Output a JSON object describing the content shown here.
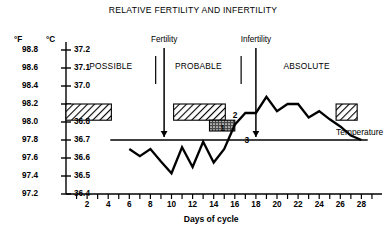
{
  "chart_data": {
    "type": "line",
    "title": "RELATIVE FERTILITY AND INFERTILITY",
    "xlabel": "Days of cycle",
    "ylabel_left": "°F",
    "ylabel_right": "°C",
    "xlim": [
      0,
      29
    ],
    "xticks": [
      1,
      2,
      3,
      4,
      5,
      6,
      7,
      8,
      9,
      10,
      11,
      12,
      13,
      14,
      15,
      16,
      17,
      18,
      19,
      20,
      21,
      22,
      23,
      24,
      25,
      26,
      27,
      28,
      29
    ],
    "xtick_labels": [
      2,
      4,
      6,
      8,
      10,
      12,
      14,
      16,
      18,
      20,
      22,
      24,
      26,
      28
    ],
    "ylim_f": [
      97.2,
      98.8
    ],
    "yticks_f": [
      "98.8",
      "98.6",
      "98.4",
      "98.2",
      "98.0",
      "97.8",
      "97.6",
      "97.4",
      "97.2"
    ],
    "yticks_c": [
      "37.2",
      "37.1",
      "37.0",
      "",
      "36.8",
      "36.7",
      "36.6",
      "36.5",
      "36.4"
    ],
    "grid": false,
    "legend_position": "right",
    "series": [
      {
        "name": "Temperature",
        "x": [
          6,
          7,
          8,
          9,
          10,
          11,
          12,
          13,
          14,
          15,
          16,
          17,
          18,
          19,
          20,
          21,
          22,
          23,
          24,
          25,
          26,
          27,
          28
        ],
        "values": [
          97.7,
          97.62,
          97.7,
          97.56,
          97.43,
          97.72,
          97.5,
          97.78,
          97.55,
          97.7,
          97.97,
          98.1,
          98.1,
          98.28,
          98.12,
          98.2,
          98.2,
          98.05,
          98.12,
          98.03,
          97.95,
          97.85,
          97.8
        ]
      }
    ],
    "coverline_f": 97.8,
    "coverline_x_start": 4.2,
    "coverline_x_end": 28.6,
    "annotations": [
      {
        "label": "Fertility",
        "type": "arrow-down",
        "x": 9.3
      },
      {
        "label": "Infertility",
        "type": "arrow-down",
        "x": 18.0
      },
      {
        "label": "1",
        "type": "marker",
        "x": 14.9,
        "y": 97.93
      },
      {
        "label": "2",
        "type": "marker",
        "x": 16.1,
        "y": 98.08
      },
      {
        "label": "3",
        "type": "marker",
        "x": 17.2,
        "y": 97.8
      }
    ],
    "zones": [
      {
        "label": "POSSIBLE",
        "x_start": 0.0,
        "x_end": 8.5
      },
      {
        "label": "PROBABLE",
        "x_start": 8.5,
        "x_end": 16.6
      },
      {
        "label": "ABSOLUTE",
        "x_start": 16.6,
        "x_end": 29.0
      }
    ],
    "bands": [
      {
        "name": "hatched-band-left",
        "pattern": "diagonal-hatch",
        "x_start": 0.0,
        "x_end": 4.3,
        "y_top": 98.2,
        "y_bottom": 98.02
      },
      {
        "name": "hatched-band-mid",
        "pattern": "diagonal-hatch",
        "x_start": 10.2,
        "x_end": 15.1,
        "y_top": 98.2,
        "y_bottom": 98.02
      },
      {
        "name": "stippled-band-mid",
        "pattern": "stipple",
        "x_start": 13.6,
        "x_end": 16.0,
        "y_top": 98.02,
        "y_bottom": 97.9
      }
    ],
    "legend": {
      "swatch_pattern": "diagonal-hatch",
      "label": "Temperature",
      "x_start": 25.6,
      "x_end": 27.6,
      "y_top": 98.2,
      "y_bottom": 98.02
    },
    "colors": {
      "line": "#000000",
      "axis": "#000000",
      "background": "#ffffff"
    }
  }
}
